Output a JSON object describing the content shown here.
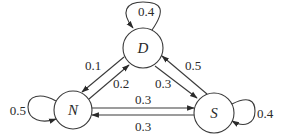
{
  "diagram": {
    "type": "state-transition",
    "nodes": [
      {
        "id": "D",
        "label": "D"
      },
      {
        "id": "N",
        "label": "N"
      },
      {
        "id": "S",
        "label": "S"
      }
    ],
    "edges": [
      {
        "from": "D",
        "to": "D",
        "label": "0.4"
      },
      {
        "from": "D",
        "to": "N",
        "label": "0.1"
      },
      {
        "from": "N",
        "to": "D",
        "label": "0.2"
      },
      {
        "from": "D",
        "to": "S",
        "label": "0.3"
      },
      {
        "from": "S",
        "to": "D",
        "label": "0.5"
      },
      {
        "from": "N",
        "to": "S",
        "label": "0.3"
      },
      {
        "from": "S",
        "to": "N",
        "label": "0.3"
      },
      {
        "from": "N",
        "to": "N",
        "label": "0.5"
      },
      {
        "from": "S",
        "to": "S",
        "label": "0.4"
      }
    ]
  }
}
